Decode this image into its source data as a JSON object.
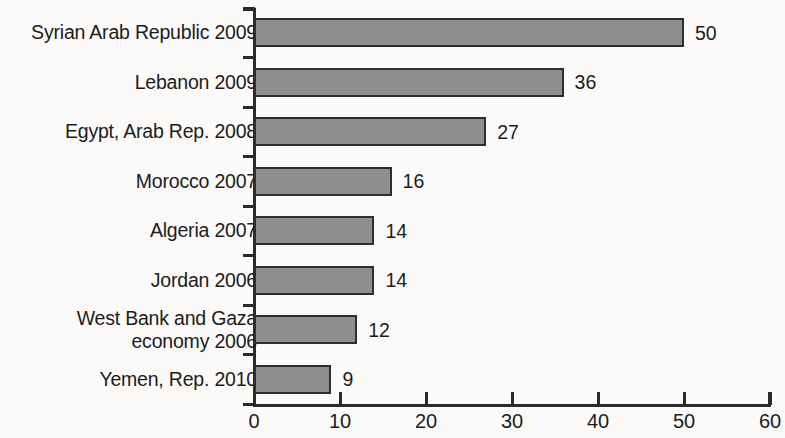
{
  "chart_data": {
    "type": "bar",
    "orientation": "horizontal",
    "title": "",
    "subtitle": "",
    "xlabel": "",
    "ylabel": "",
    "xlim": [
      0,
      60
    ],
    "xticks": [
      0,
      10,
      20,
      30,
      40,
      50,
      60
    ],
    "grid": false,
    "legend": null,
    "show_value_labels": true,
    "categories": [
      "Syrian Arab Republic 2009",
      "Lebanon 2009",
      "Egypt, Arab Rep. 2008",
      "Morocco 2007",
      "Algeria 2007",
      "Jordan 2006",
      "West Bank and Gaza economy 2006",
      "Yemen, Rep. 2010"
    ],
    "category_lines": [
      [
        "Syrian Arab Republic 2009"
      ],
      [
        "Lebanon 2009"
      ],
      [
        "Egypt, Arab Rep. 2008"
      ],
      [
        "Morocco 2007"
      ],
      [
        "Algeria 2007"
      ],
      [
        "Jordan 2006"
      ],
      [
        "West Bank and Gaza",
        "economy 2006"
      ],
      [
        "Yemen, Rep. 2010"
      ]
    ],
    "values": [
      50,
      36,
      27,
      16,
      14,
      14,
      12,
      9
    ],
    "value_labels": [
      "50",
      "36",
      "27",
      "16",
      "14",
      "14",
      "12",
      "9"
    ],
    "colors": {
      "bar_fill": "#8e8e8e",
      "bar_border": "#2e2e2e",
      "axis": "#2b2b2b",
      "text": "#1c1c1c",
      "background": "#fbfaf8"
    }
  }
}
